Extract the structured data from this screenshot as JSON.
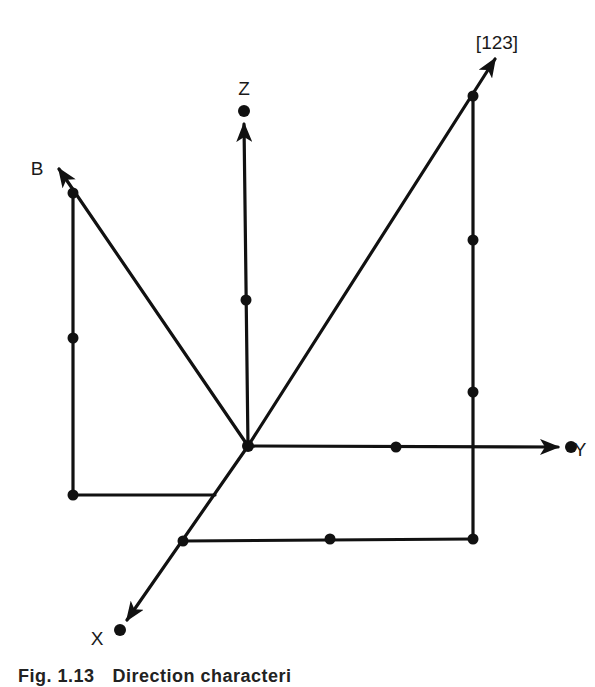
{
  "figure": {
    "labels": {
      "z_axis": "Z",
      "y_axis": "Y",
      "x_axis": "X",
      "b_vector": "B",
      "direction_vector": "[123]"
    },
    "caption": {
      "number": "Fig. 1.13",
      "text": "Direction characteri"
    },
    "colors": {
      "ink": "#111111",
      "background": "#ffffff"
    }
  },
  "geometry": {
    "origin": [
      248,
      446
    ],
    "axes": {
      "Z": {
        "from": [
          248,
          446
        ],
        "to": [
          244,
          111
        ],
        "points": [
          [
            246,
            300
          ],
          [
            244,
            111
          ]
        ]
      },
      "Y": {
        "from": [
          248,
          446
        ],
        "to": [
          571,
          447
        ],
        "points": [
          [
            396,
            447
          ],
          [
            571,
            447
          ]
        ]
      },
      "X": {
        "from": [
          248,
          446
        ],
        "to": [
          120,
          630
        ],
        "points": [
          [
            183,
            541
          ],
          [
            120,
            630
          ]
        ]
      }
    },
    "vectors": {
      "B": {
        "from": [
          248,
          446
        ],
        "tip": [
          57,
          167
        ],
        "points": [
          [
            73,
            193
          ]
        ]
      },
      "[123]": {
        "from": [
          248,
          446
        ],
        "tip": [
          497,
          57
        ],
        "points": [
          [
            473,
            96
          ]
        ]
      }
    },
    "construction_lines": {
      "B_vertical": {
        "from": [
          73,
          193
        ],
        "to": [
          73,
          495
        ],
        "points": [
          [
            73,
            338
          ],
          [
            73,
            495
          ]
        ]
      },
      "B_horizontal": {
        "from": [
          73,
          495
        ],
        "to": [
          215,
          495
        ]
      },
      "d123_vertical": {
        "from": [
          473,
          96
        ],
        "to": [
          473,
          539
        ],
        "points": [
          [
            473,
            240
          ],
          [
            473,
            392
          ],
          [
            473,
            539
          ]
        ]
      },
      "d123_horizontal": {
        "from": [
          183,
          541
        ],
        "to": [
          473,
          539
        ],
        "points": [
          [
            330,
            539
          ]
        ]
      }
    }
  }
}
